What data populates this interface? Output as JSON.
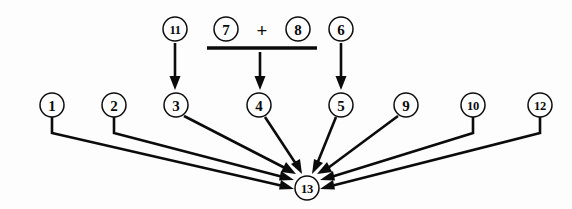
{
  "figure": {
    "kind": "dependency-diagram",
    "background_color": "#fdfdfd",
    "ink_color": "#0b0b0b",
    "width": 572,
    "height": 209
  },
  "nodes": {
    "top_row": [
      {
        "id": "n11",
        "label": "11",
        "cx": 175,
        "cy": 29,
        "r": 12
      },
      {
        "id": "n7",
        "label": "7",
        "cx": 226,
        "cy": 29,
        "r": 12
      },
      {
        "id": "n8",
        "label": "8",
        "cx": 298,
        "cy": 29,
        "r": 12
      },
      {
        "id": "n6",
        "label": "6",
        "cx": 341,
        "cy": 29,
        "r": 12
      }
    ],
    "middle_row": [
      {
        "id": "n1",
        "label": "1",
        "cx": 52,
        "cy": 105,
        "r": 12
      },
      {
        "id": "n2",
        "label": "2",
        "cx": 114,
        "cy": 105,
        "r": 12
      },
      {
        "id": "n3",
        "label": "3",
        "cx": 176,
        "cy": 105,
        "r": 12
      },
      {
        "id": "n4",
        "label": "4",
        "cx": 259,
        "cy": 105,
        "r": 12
      },
      {
        "id": "n5",
        "label": "5",
        "cx": 341,
        "cy": 105,
        "r": 12
      },
      {
        "id": "n9",
        "label": "9",
        "cx": 406,
        "cy": 105,
        "r": 12
      },
      {
        "id": "n10",
        "label": "10",
        "cx": 473,
        "cy": 105,
        "r": 12
      },
      {
        "id": "n12",
        "label": "12",
        "cx": 540,
        "cy": 105,
        "r": 12
      }
    ],
    "sink": {
      "id": "n13",
      "label": "13",
      "cx": 307,
      "cy": 188,
      "r": 12
    }
  },
  "operators": [
    {
      "id": "plus",
      "symbol": "+",
      "x": 262,
      "y": 30
    }
  ],
  "fraction_bar": {
    "x1": 207,
    "x2": 317,
    "y": 48
  },
  "edges": [
    {
      "id": "e-11-3",
      "from": "11",
      "to": "3",
      "type": "vertical"
    },
    {
      "id": "e-frac-4",
      "from": "7 + 8",
      "to": "4",
      "type": "vertical"
    },
    {
      "id": "e-6-5",
      "from": "6",
      "to": "5",
      "type": "vertical"
    },
    {
      "id": "e-1-13",
      "from": "1",
      "to": "13",
      "type": "elbow-diagonal"
    },
    {
      "id": "e-2-13",
      "from": "2",
      "to": "13",
      "type": "elbow-diagonal"
    },
    {
      "id": "e-3-13",
      "from": "3",
      "to": "13",
      "type": "diagonal"
    },
    {
      "id": "e-4-13",
      "from": "4",
      "to": "13",
      "type": "diagonal"
    },
    {
      "id": "e-5-13",
      "from": "5",
      "to": "13",
      "type": "diagonal"
    },
    {
      "id": "e-9-13",
      "from": "9",
      "to": "13",
      "type": "diagonal"
    },
    {
      "id": "e-10-13",
      "from": "10",
      "to": "13",
      "type": "elbow-diagonal"
    },
    {
      "id": "e-12-13",
      "from": "12",
      "to": "13",
      "type": "elbow-diagonal"
    }
  ]
}
